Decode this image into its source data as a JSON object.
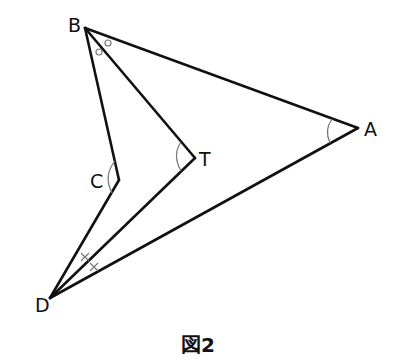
{
  "figure": {
    "caption": "図2",
    "stroke_color": "#111111",
    "mark_color": "#888888"
  },
  "points": {
    "A": {
      "label": "A",
      "x": 358,
      "y": 128
    },
    "B": {
      "label": "B",
      "x": 85,
      "y": 28
    },
    "C": {
      "label": "C",
      "x": 119,
      "y": 180
    },
    "D": {
      "label": "D",
      "x": 50,
      "y": 298
    },
    "T": {
      "label": "T",
      "x": 195,
      "y": 158
    }
  },
  "segments": [
    "BA",
    "AD",
    "BC",
    "CD",
    "BT",
    "TD"
  ],
  "angle_marks": [
    {
      "vertex": "A",
      "type": "arc"
    },
    {
      "vertex": "T",
      "type": "arc"
    },
    {
      "vertex": "C",
      "type": "arc"
    },
    {
      "vertex": "B",
      "type": "equal-circles",
      "count": 2
    },
    {
      "vertex": "D",
      "type": "equal-crosses",
      "count": 2
    }
  ]
}
